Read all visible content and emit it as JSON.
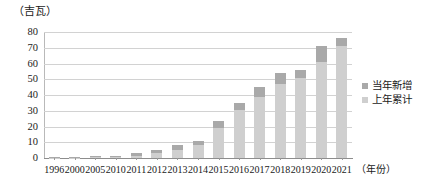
{
  "chart_data": {
    "type": "bar",
    "subtype": "stacked-bar",
    "title": "",
    "unit_label": "（吉瓦）",
    "xlabel": "（年份）",
    "ylabel": "",
    "ylim": [
      0,
      80
    ],
    "ytick_step": 10,
    "yticks": [
      "80",
      "70",
      "60",
      "50",
      "40",
      "30",
      "20",
      "10",
      "0"
    ],
    "grid": true,
    "grid_axis": "y",
    "legend_position": "right",
    "categories": [
      "1996",
      "2000",
      "2005",
      "2010",
      "2011",
      "2012",
      "2013",
      "2014",
      "2015",
      "2016",
      "2017",
      "2018",
      "2019",
      "2020",
      "2021"
    ],
    "series": [
      {
        "name": "上年累计",
        "color": "#cfcfcf",
        "values": [
          0.2,
          0.3,
          0.5,
          0.8,
          1.5,
          3.0,
          5.0,
          8.0,
          19.0,
          30.5,
          39.0,
          47.0,
          51.0,
          61.0,
          71.0
        ]
      },
      {
        "name": "当年新增",
        "color": "#a9a9a9",
        "values": [
          0.1,
          0.2,
          0.3,
          0.7,
          1.5,
          2.0,
          3.0,
          2.5,
          4.5,
          4.5,
          6.0,
          7.0,
          5.0,
          10.0,
          5.0
        ]
      }
    ],
    "totals": [
      0.3,
      0.5,
      0.8,
      1.5,
      3.0,
      5.0,
      8.0,
      10.5,
      23.5,
      35.0,
      45.0,
      54.0,
      56.0,
      71.0,
      76.0
    ]
  },
  "legend": {
    "items": [
      {
        "label": "当年新增",
        "color": "#a9a9a9"
      },
      {
        "label": "上年累计",
        "color": "#cfcfcf"
      }
    ]
  }
}
